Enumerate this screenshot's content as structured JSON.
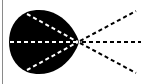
{
  "diagram": {
    "colors": {
      "background": "#ffffff",
      "shape_fill": "#000000",
      "inner_dashes": "#ffffff",
      "outer_dashes": "#000000",
      "frame_line": "#8a8a8a"
    },
    "focal_point": {
      "x": 78,
      "y": 42
    },
    "inner_rays": [
      {
        "from": [
          27,
          14
        ],
        "to": [
          78,
          42
        ]
      },
      {
        "from": [
          10,
          42
        ],
        "to": [
          78,
          42
        ]
      },
      {
        "from": [
          27,
          70
        ],
        "to": [
          78,
          42
        ]
      }
    ],
    "outer_rays": [
      {
        "from": [
          78,
          42
        ],
        "to": [
          136,
          11
        ]
      },
      {
        "from": [
          78,
          42
        ],
        "to": [
          141,
          42
        ]
      },
      {
        "from": [
          78,
          42
        ],
        "to": [
          136,
          73
        ]
      }
    ]
  }
}
